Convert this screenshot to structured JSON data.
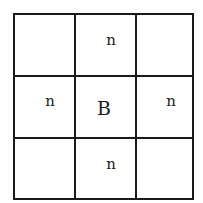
{
  "diagram": {
    "type": "3x3 neighborhood grid",
    "cells": [
      [
        "",
        "n",
        ""
      ],
      [
        "n",
        "B",
        "n"
      ],
      [
        "",
        "n",
        ""
      ]
    ],
    "labels": {
      "top": "n",
      "left": "n",
      "center": "B",
      "right": "n",
      "bottom": "n"
    },
    "line_color": "#1a1a1a"
  }
}
